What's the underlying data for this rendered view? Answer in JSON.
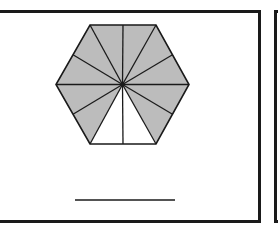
{
  "figure": {
    "total_parts": 12,
    "shaded_parts": 10,
    "unshaded_parts": 2,
    "colors": {
      "shaded": "#bcbcbc",
      "unshaded": "#ffffff",
      "stroke": "#1a1a1a"
    },
    "center": [
      122.5,
      84.5
    ],
    "vertices": [
      [
        90,
        25
      ],
      [
        156,
        25
      ],
      [
        189,
        84.5
      ],
      [
        156,
        144
      ],
      [
        90,
        144
      ],
      [
        56,
        84.5
      ]
    ],
    "answer_line": {
      "x1": 75,
      "x2": 175,
      "y": 200
    }
  }
}
